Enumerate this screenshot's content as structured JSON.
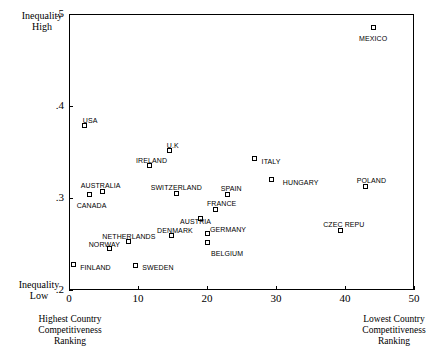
{
  "chart_data": {
    "type": "scatter",
    "title": "",
    "xlabel": "Country Competitiveness Ranking",
    "ylabel": "Inequality",
    "xlim": [
      0,
      50
    ],
    "ylim": [
      0.2,
      0.5
    ],
    "grid": false,
    "legend": "none",
    "x_ticks": [
      "0",
      "10",
      "20",
      "30",
      "40",
      "50"
    ],
    "x_tick_values": [
      0,
      10,
      20,
      30,
      40,
      50
    ],
    "y_ticks": [
      ".5",
      ".4",
      ".3",
      ".2"
    ],
    "y_tick_values": [
      0.5,
      0.4,
      0.3,
      0.2
    ],
    "axis_notes": {
      "y_top_line1": "Inequality",
      "y_top_line2": "High",
      "y_bottom_line1": "Inequality",
      "y_bottom_line2": "Low",
      "x_left_line1": "Highest Country",
      "x_left_line2": "Competitiveness",
      "x_left_line3": "Ranking",
      "x_right_line1": "Lowest Country",
      "x_right_line2": "Competitiveness",
      "x_right_line3": "Ranking"
    },
    "points": [
      {
        "label": "MEXICO",
        "x": 44.2,
        "y": 0.4848,
        "lx": -15,
        "ly": 7
      },
      {
        "label": "USA",
        "x": 2.3,
        "y": 0.3783,
        "lx": -2,
        "ly": -9
      },
      {
        "label": "U.K",
        "x": 14.6,
        "y": 0.3511,
        "lx": -3,
        "ly": -9
      },
      {
        "label": "IRELAND",
        "x": 11.6,
        "y": 0.3348,
        "lx": -13,
        "ly": -9
      },
      {
        "label": "ITALY",
        "x": 26.9,
        "y": 0.3424,
        "lx": 7,
        "ly": -1
      },
      {
        "label": "AUSTRALIA",
        "x": 4.9,
        "y": 0.3076,
        "lx": -22,
        "ly": -9
      },
      {
        "label": "CANADA",
        "x": 3.0,
        "y": 0.3043,
        "lx": -13,
        "ly": 8
      },
      {
        "label": "SWITZERLAND",
        "x": 15.6,
        "y": 0.3054,
        "lx": -26,
        "ly": -9
      },
      {
        "label": "HUNGARY",
        "x": 29.4,
        "y": 0.3196,
        "lx": 11,
        "ly": -1
      },
      {
        "label": "POLAND",
        "x": 43.0,
        "y": 0.313,
        "lx": -9,
        "ly": -9
      },
      {
        "label": "SPAIN",
        "x": 23.0,
        "y": 0.3043,
        "lx": -7,
        "ly": -9
      },
      {
        "label": "FRANCE",
        "x": 21.3,
        "y": 0.288,
        "lx": -9,
        "ly": -9
      },
      {
        "label": "AUSTRIA",
        "x": 19.0,
        "y": 0.2772,
        "lx": -20,
        "ly": -1
      },
      {
        "label": "NETHERLANDS",
        "x": 8.6,
        "y": 0.2522,
        "lx": -26,
        "ly": -9
      },
      {
        "label": "DENMARK",
        "x": 14.8,
        "y": 0.2587,
        "lx": -14,
        "ly": -9
      },
      {
        "label": "GERMANY",
        "x": 20.0,
        "y": 0.2609,
        "lx": 3,
        "ly": -8
      },
      {
        "label": "BELGIUM",
        "x": 20.0,
        "y": 0.2511,
        "lx": 4,
        "ly": 7
      },
      {
        "label": "CZEC REPU",
        "x": 39.3,
        "y": 0.2652,
        "lx": -17,
        "ly": -9
      },
      {
        "label": "NORWAY",
        "x": 5.9,
        "y": 0.2446,
        "lx": -21,
        "ly": -8
      },
      {
        "label": "FINLAND",
        "x": 0.6,
        "y": 0.2272,
        "lx": 7,
        "ly": -1
      },
      {
        "label": "SWEDEN",
        "x": 9.6,
        "y": 0.2261,
        "lx": 7,
        "ly": -2
      }
    ]
  }
}
